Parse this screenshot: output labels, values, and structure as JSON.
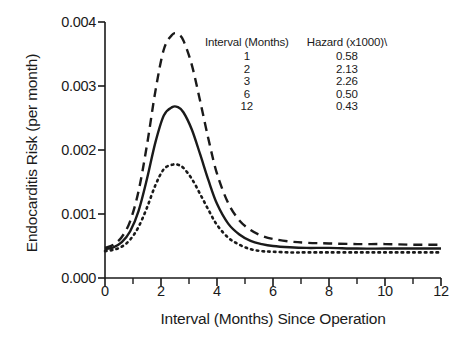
{
  "chart_data": {
    "type": "line",
    "title": "",
    "xlabel": "Interval (Months) Since Operation",
    "ylabel": "Endocarditis Risk (per month)",
    "xlim": [
      0,
      12
    ],
    "ylim": [
      0,
      0.004
    ],
    "grid": false,
    "legend_position": "inset-top-center",
    "xticks": [
      0,
      2,
      4,
      6,
      8,
      10,
      12
    ],
    "xtick_labels": [
      "0",
      "2",
      "4",
      "6",
      "8",
      "10",
      "12"
    ],
    "xminor_ticks": [
      1,
      3,
      5,
      7,
      9,
      11
    ],
    "yticks": [
      0.0,
      0.001,
      0.002,
      0.003,
      0.004
    ],
    "ytick_labels": [
      "0.000",
      "0.001",
      "0.002",
      "0.003",
      "0.004"
    ],
    "series": [
      {
        "name": "Upper confidence limit",
        "style": "dashed",
        "x": [
          0.0,
          0.3,
          0.6,
          0.9,
          1.2,
          1.5,
          1.8,
          2.1,
          2.4,
          2.6,
          2.8,
          3.1,
          3.4,
          3.7,
          4.0,
          4.4,
          4.8,
          5.2,
          5.6,
          6.0,
          6.6,
          7.2,
          8.0,
          9.0,
          10.0,
          11.0,
          12.0
        ],
        "values": [
          0.00047,
          0.00052,
          0.00064,
          0.00089,
          0.00136,
          0.00208,
          0.00292,
          0.00357,
          0.0038,
          0.00381,
          0.00371,
          0.00333,
          0.00276,
          0.00216,
          0.00163,
          0.00117,
          0.0009,
          0.00075,
          0.00066,
          0.00061,
          0.00057,
          0.00055,
          0.00054,
          0.00053,
          0.00053,
          0.00052,
          0.00052
        ]
      },
      {
        "name": "Parametric hazard estimate",
        "style": "solid",
        "x": [
          0.0,
          0.3,
          0.6,
          0.9,
          1.2,
          1.5,
          1.8,
          2.1,
          2.4,
          2.6,
          2.8,
          3.1,
          3.4,
          3.7,
          4.0,
          4.4,
          4.8,
          5.2,
          5.6,
          6.0,
          6.6,
          7.2,
          8.0,
          9.0,
          10.0,
          11.0,
          12.0
        ],
        "values": [
          0.00045,
          0.00048,
          0.00056,
          0.00073,
          0.00105,
          0.00155,
          0.00212,
          0.00254,
          0.00267,
          0.00267,
          0.00259,
          0.00232,
          0.00193,
          0.00152,
          0.00116,
          0.00085,
          0.00068,
          0.00058,
          0.00053,
          0.0005,
          0.00048,
          0.00047,
          0.00047,
          0.00046,
          0.00046,
          0.00046,
          0.00046
        ]
      },
      {
        "name": "Lower confidence limit",
        "style": "dotted",
        "x": [
          0.0,
          0.3,
          0.6,
          0.9,
          1.2,
          1.5,
          1.8,
          2.1,
          2.4,
          2.6,
          2.8,
          3.1,
          3.4,
          3.7,
          4.0,
          4.4,
          4.8,
          5.2,
          5.6,
          6.0,
          6.6,
          7.2,
          8.0,
          9.0,
          10.0,
          11.0,
          12.0
        ],
        "values": [
          0.00042,
          0.00044,
          0.00049,
          0.0006,
          0.0008,
          0.0011,
          0.00145,
          0.0017,
          0.00177,
          0.00177,
          0.00172,
          0.00155,
          0.00131,
          0.00106,
          0.00083,
          0.00063,
          0.00052,
          0.00045,
          0.00042,
          0.00041,
          0.0004,
          0.0004,
          0.0004,
          0.0004,
          0.0004,
          0.0004,
          0.0004
        ]
      }
    ],
    "inset_table": {
      "columns": [
        "Interval (Months)",
        "Hazard (x1000)\\"
      ],
      "rows": [
        [
          "1",
          "0.58"
        ],
        [
          "2",
          "2.13"
        ],
        [
          "3",
          "2.26"
        ],
        [
          "6",
          "0.50"
        ],
        [
          "12",
          "0.43"
        ]
      ]
    }
  },
  "colors": {
    "axis": "#1a1a1a",
    "curve": "#1a1a1a",
    "background": "#ffffff"
  }
}
